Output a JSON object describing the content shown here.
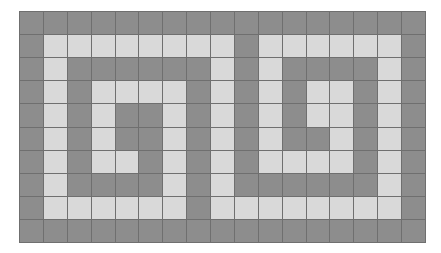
{
  "figure": {
    "columns": 17,
    "rows": 10,
    "colors": {
      "dark": "#8d8d8d",
      "light": "#d9d9d9",
      "gridline": "#6f6f6f",
      "background": "#ffffff"
    },
    "legend": {
      "D": "dark cell",
      "L": "light cell"
    },
    "cells": [
      "DDDDDDDDDDDDDDDDD",
      "DLLLLLLLLDLLLLLLD",
      "DLDDDDDDLDLDDDDLD",
      "DLDLLLLDLDLDLLDLD",
      "DLDLDDLDLDLDLLDLD",
      "DLDLDDLDLDLDDLDLD",
      "DLDLLDLDLDLLLLDLD",
      "DLDDDDLDLDDDDDDLD",
      "DLLLLLLDLLLLLLLLD",
      "DDDDDDDDDDDDDDDDD"
    ]
  }
}
